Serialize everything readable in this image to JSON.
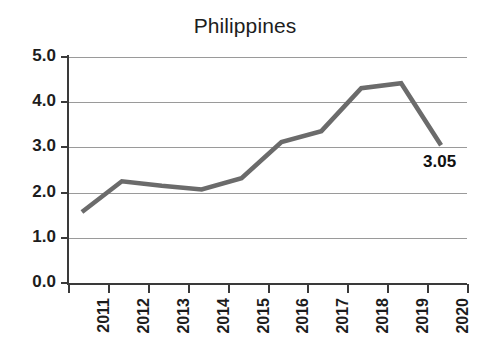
{
  "chart_data": {
    "type": "line",
    "title": "Philippines",
    "xlabel": "",
    "ylabel": "",
    "categories": [
      "2011",
      "2012",
      "2013",
      "2014",
      "2015",
      "2016",
      "2017",
      "2018",
      "2019",
      "2020"
    ],
    "values": [
      1.57,
      2.25,
      2.15,
      2.07,
      2.32,
      3.12,
      3.36,
      4.31,
      4.42,
      3.05
    ],
    "series": [
      {
        "name": "Philippines",
        "values": [
          1.57,
          2.25,
          2.15,
          2.07,
          2.32,
          3.12,
          3.36,
          4.31,
          4.42,
          3.05
        ]
      }
    ],
    "ylim": [
      0.0,
      5.0
    ],
    "ytick_labels": [
      "5.0",
      "4.0",
      "3.0",
      "2.0",
      "1.0",
      "0.0"
    ],
    "ytick_values": [
      5.0,
      4.0,
      3.0,
      2.0,
      1.0,
      0.0
    ],
    "grid": true,
    "legend": false,
    "legend_position": "none",
    "annotations": [
      {
        "text": "3.05",
        "category": "2020",
        "value": 3.05
      }
    ],
    "line_color": "#6b6b6b",
    "grid_color": "#9a9a9a",
    "axis_color": "#3a3a3a",
    "text_color": "#1d1d1d",
    "background_color": "#ffffff"
  }
}
